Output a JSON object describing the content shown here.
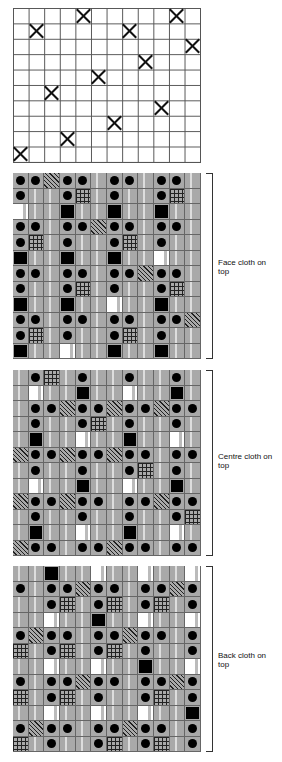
{
  "top_grid": {
    "cols": 12,
    "rows": 10,
    "marks": [
      [
        0,
        4
      ],
      [
        0,
        10
      ],
      [
        1,
        1
      ],
      [
        1,
        7
      ],
      [
        2,
        11
      ],
      [
        3,
        8
      ],
      [
        4,
        5
      ],
      [
        5,
        2
      ],
      [
        6,
        9
      ],
      [
        7,
        6
      ],
      [
        8,
        3
      ],
      [
        9,
        0
      ]
    ]
  },
  "legend_codes": {
    "D": "dot",
    "H": "diagonal-hatch",
    "X": "cross-hatch",
    "B": "black-square",
    "W": "white-square",
    "G": "gray"
  },
  "panels": [
    {
      "label": "Face cloth on top",
      "top": 173,
      "rows": [
        "DDHDDGDDGDDG",
        "DGGDXGDGGDXG",
        "WGGBGGBGGBGG",
        "DDGDDHDDGDDG",
        "DXGDGGDXGDGG",
        "BGGBGGBGGWGG",
        "DDGDDGDDHDDG",
        "DGGDXGDGGDXG",
        "BGGBGGWGGBGG",
        "DDGDDGDDGDDH",
        "DXGDGGDXGDGG",
        "BGGWGGBGGBGG"
      ]
    },
    {
      "label": "Centre cloth on top",
      "top": 370,
      "rows": [
        "GDXGDGGDGGDG",
        "GWGGBGGWGGBG",
        "GDDHDDHDDHDD",
        "GDGGDXGDGGDG",
        "GBGGWGGBGGWG",
        "HDDHDDHDDGDD",
        "GDGGDGGDXGDG",
        "GWGGBGGWGGBG",
        "HDDHDDGDDHDD",
        "GDGGDGGDGGDX",
        "GBGGWGGBGGWG",
        "HDDGDDHDDGDD"
      ]
    },
    {
      "label": "Back cloth on top",
      "top": 566,
      "rows": [
        "GGBGGWGGWGGW",
        "DGDDHDDGDDHD",
        "GGDXGDXGDXGD",
        "GGWGGBGGWGGW",
        "DHDDGDDHDDGD",
        "XGDXGDXGDGGD",
        "GGWGGWGGBGGW",
        "DGDDHDDGDDHD",
        "XGDXGDGGDXGD",
        "GGWGGWGGWGGB",
        "DHDDGDDHDDGD",
        "XGDGGDXGDXGD"
      ]
    }
  ],
  "labels": {
    "face": "Face cloth on top",
    "centre": "Centre cloth on top",
    "back": "Back cloth on top"
  }
}
